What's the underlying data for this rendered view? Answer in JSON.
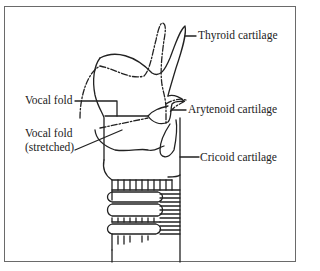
{
  "figure": {
    "type": "labeled anatomical diagram",
    "line_color": "#222222",
    "frame_color": "#6a6a6a",
    "labels": {
      "thyroid": "Thyroid cartilage",
      "arytenoid": "Arytenoid cartilage",
      "vocal_fold": "Vocal fold",
      "vocal_fold_stretched_line1": "Vocal fold",
      "vocal_fold_stretched_line2": "(stretched)",
      "cricoid": "Cricoid cartilage"
    },
    "legend_notes": {
      "solid_outline": "resting position",
      "dash_dot_outline": "tilted/stretched position"
    }
  }
}
